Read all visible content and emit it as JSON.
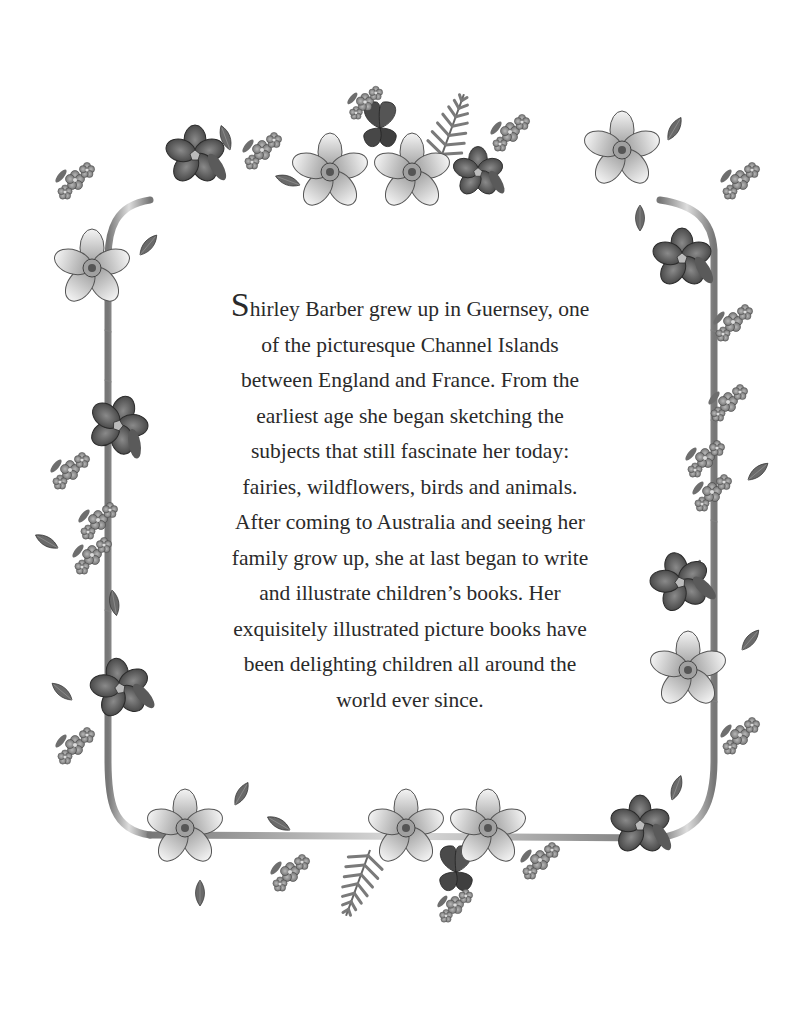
{
  "page": {
    "background": "#ffffff",
    "text_color": "#2a2a2a",
    "border_style": "grayscale floral garland with ribbon frame",
    "border_elements": {
      "top": [
        "forget-me-not",
        "violet",
        "forget-me-not",
        "daffodil",
        "clover",
        "fern",
        "daffodil",
        "violet",
        "forget-me-not",
        "daffodil",
        "forget-me-not"
      ],
      "bottom": [
        "daffodil",
        "forget-me-not",
        "fern",
        "daffodil",
        "clover",
        "daffodil",
        "forget-me-not",
        "violet"
      ],
      "left": [
        "daffodil",
        "violet",
        "forget-me-not",
        "violet",
        "forget-me-not"
      ],
      "right": [
        "violet",
        "forget-me-not",
        "forget-me-not",
        "violet",
        "daffodil",
        "forget-me-not"
      ]
    }
  },
  "bio": {
    "drop_cap": "S",
    "lines": [
      "hirley Barber grew up in Guernsey, one",
      "of the picturesque Channel Islands",
      "between England and France. From the",
      "earliest age she began sketching the",
      "subjects that still fascinate her today:",
      "fairies, wildflowers, birds and animals.",
      "After coming to Australia and seeing her",
      "family grow up, she at last began to write",
      "and illustrate children’s books. Her",
      "exquisitely illustrated picture books have",
      "been delighting children all around the",
      "world ever since."
    ]
  }
}
